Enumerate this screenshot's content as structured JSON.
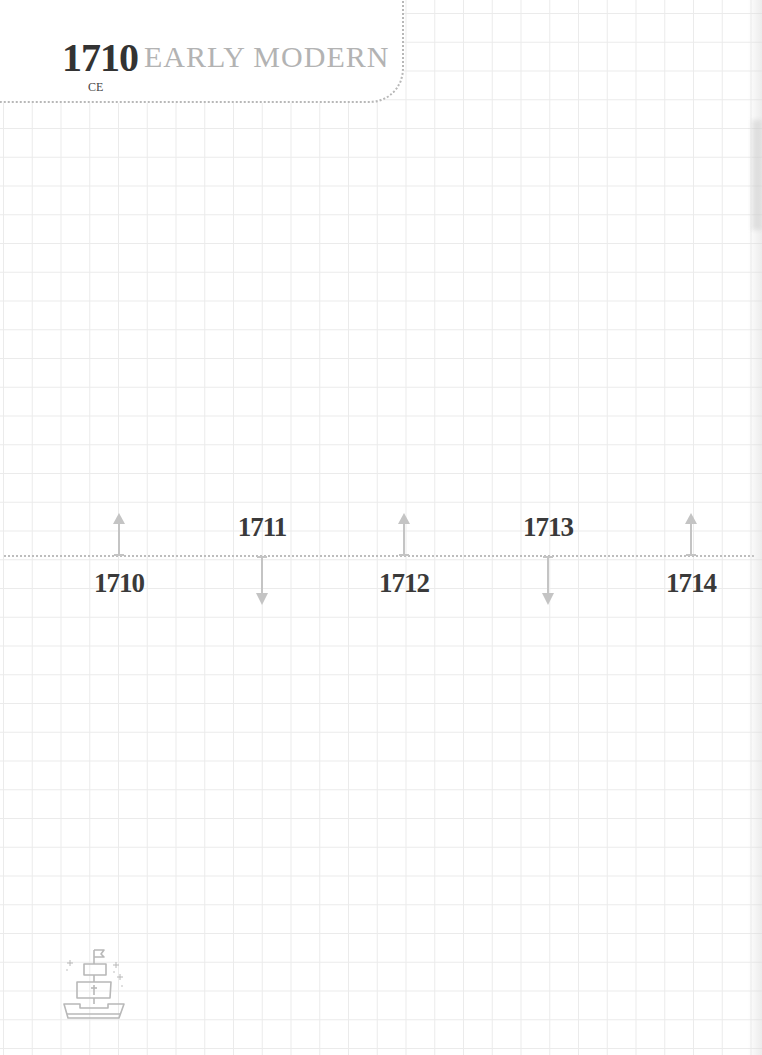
{
  "header": {
    "year": "1710",
    "era_suffix": "CE",
    "period": "EARLY MODERN"
  },
  "timeline": {
    "events": [
      {
        "year": "1710",
        "x": 119,
        "direction": "up",
        "label_position": "below"
      },
      {
        "year": "1711",
        "x": 262,
        "direction": "down",
        "label_position": "above"
      },
      {
        "year": "1712",
        "x": 404,
        "direction": "up",
        "label_position": "below"
      },
      {
        "year": "1713",
        "x": 548,
        "direction": "down",
        "label_position": "above"
      },
      {
        "year": "1714",
        "x": 691,
        "direction": "up",
        "label_position": "below"
      }
    ]
  },
  "decoration": {
    "icon": "sailing-ship-icon"
  },
  "colors": {
    "year_text": "#333333",
    "period_text": "#b3b3b3",
    "arrow": "#c4c4c4",
    "grid": "#ebebeb",
    "dotted_line": "#bdbdbd"
  }
}
